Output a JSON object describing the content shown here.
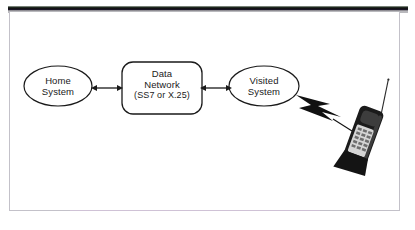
{
  "figure": {
    "background_color": "#ffffff",
    "border_color": "#c3c1c9",
    "stroke_color": "#1a1a1a"
  },
  "nodes": {
    "home": {
      "shape": "ellipse",
      "line1": "Home",
      "line2": "System"
    },
    "network": {
      "shape": "rounded-rectangle",
      "line1": "Data",
      "line2": "Network",
      "line3": "(SS7 or X.25)"
    },
    "visited": {
      "shape": "ellipse",
      "line1": "Visited",
      "line2": "System"
    }
  },
  "connectors": [
    {
      "name": "home-to-network",
      "style": "double-headed-arrow"
    },
    {
      "name": "network-to-visited",
      "style": "double-headed-arrow"
    },
    {
      "name": "visited-to-handset",
      "style": "lightning-bolt"
    }
  ],
  "handset": {
    "name": "mobile-phone",
    "type": "flip-phone",
    "body_color": "#1b1b1b",
    "keypad_color": "#d5d5d5",
    "has_antenna": true
  }
}
